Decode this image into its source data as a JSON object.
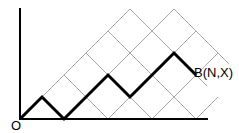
{
  "diagram": {
    "type": "lattice-path",
    "colors": {
      "grid": "#a8a8a8",
      "path": "#000000",
      "axis": "#000000"
    },
    "origin_label": "O",
    "endpoint_label": "B(N,X)",
    "lattice": {
      "origin_px": [
        20,
        119
      ],
      "step_px": 22
    },
    "path_points": [
      [
        0,
        0
      ],
      [
        1,
        1
      ],
      [
        2,
        0
      ],
      [
        4,
        2
      ],
      [
        5,
        1
      ],
      [
        7,
        3
      ],
      [
        8,
        2
      ]
    ],
    "grid_up_lines": [
      [
        [
          0,
          0
        ],
        [
          5,
          5
        ]
      ],
      [
        [
          2,
          0
        ],
        [
          7,
          5
        ]
      ],
      [
        [
          4,
          0
        ],
        [
          8,
          4
        ]
      ],
      [
        [
          6,
          0
        ],
        [
          9,
          3
        ]
      ],
      [
        [
          8,
          0
        ],
        [
          9,
          1
        ]
      ]
    ],
    "grid_down_lines": [
      [
        [
          1,
          1
        ],
        [
          2,
          0
        ]
      ],
      [
        [
          2,
          2
        ],
        [
          4,
          0
        ]
      ],
      [
        [
          3,
          3
        ],
        [
          6,
          0
        ]
      ],
      [
        [
          4,
          4
        ],
        [
          8,
          0
        ]
      ],
      [
        [
          5,
          5
        ],
        [
          8.5,
          1.5
        ]
      ],
      [
        [
          6,
          4
        ],
        [
          8.5,
          1.5
        ]
      ],
      [
        [
          7,
          5
        ],
        [
          9.5,
          2.5
        ]
      ],
      [
        [
          8,
          4
        ],
        [
          9.4,
          2.6
        ]
      ]
    ]
  }
}
